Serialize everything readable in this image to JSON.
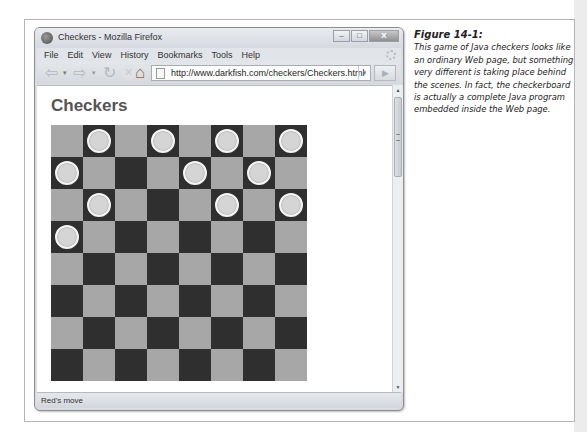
{
  "window": {
    "title": "Checkers - Mozilla Firefox",
    "controls": {
      "minimize": "–",
      "maximize": "□",
      "close": "X"
    }
  },
  "menubar": {
    "items": [
      {
        "label": "File",
        "accel": "F"
      },
      {
        "label": "Edit",
        "accel": "E"
      },
      {
        "label": "View",
        "accel": "V"
      },
      {
        "label": "History",
        "accel": "s"
      },
      {
        "label": "Bookmarks",
        "accel": "B"
      },
      {
        "label": "Tools",
        "accel": "T"
      },
      {
        "label": "Help",
        "accel": "H"
      }
    ]
  },
  "navbar": {
    "icons": {
      "back": "⇦",
      "back_drop": "▾",
      "forward": "⇨",
      "forward_drop": "▾",
      "reload": "↻",
      "stop": "✕",
      "home": "⌂"
    },
    "url": "http://www.darkfish.com/checkers/Checkers.html",
    "url_dropdown": "▼",
    "go": "▶"
  },
  "page": {
    "heading": "Checkers",
    "board": {
      "rows": 8,
      "cols": 8,
      "pieces": [
        [
          0,
          1
        ],
        [
          0,
          3
        ],
        [
          0,
          5
        ],
        [
          0,
          7
        ],
        [
          1,
          0
        ],
        [
          1,
          4
        ],
        [
          1,
          6
        ],
        [
          2,
          1
        ],
        [
          2,
          5
        ],
        [
          2,
          7
        ],
        [
          3,
          0
        ]
      ],
      "colors": {
        "light": "#a7a7a7",
        "dark": "#2f2f2f",
        "piece": "#d5d5d5"
      }
    }
  },
  "scrollbar": {
    "up": "▲",
    "down": "▼"
  },
  "status": {
    "text": "Red's move"
  },
  "caption": {
    "title": "Figure 14-1:",
    "body": "This game of Java checkers looks like an ordinary Web page, but something very different is taking place behind the scenes. In fact, the checkerboard is actually a complete Java program embedded inside the Web page."
  }
}
